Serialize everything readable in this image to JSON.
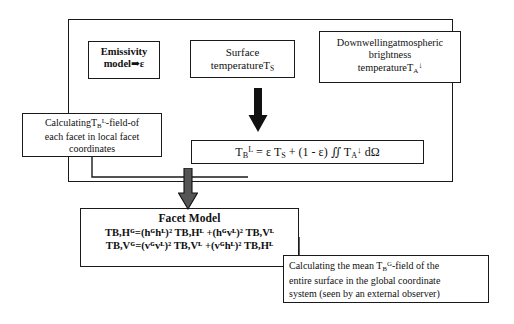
{
  "diagram": {
    "ink_color": "#1a1a1a",
    "background": "#ffffff"
  },
  "outer_frame": {
    "name": "local-facet-coordinate-stage-frame"
  },
  "inputs": [
    {
      "id": "emissivity",
      "line1": "Emissivity",
      "line2_prefix": "model",
      "arrow_glyph": "➡",
      "line2_suffix": "ε"
    },
    {
      "id": "surface_temperature",
      "line1": "Surface",
      "line2_text": "temperatureT",
      "line2_sub": "S"
    },
    {
      "id": "downwelling",
      "line1": "Downwellingatmospheric",
      "line2": "brightness",
      "line3_text": "temperatureT",
      "line3_sub": "A",
      "line3_arrow": "↓"
    }
  ],
  "calc_local": {
    "line1_pre": "Calculating",
    "line1_sym_base": "T",
    "line1_sym_sub": "B",
    "line1_sym_sup": "L",
    "line1_post": "-field-of",
    "line2": "each facet in local facet",
    "line3": "coordinates"
  },
  "equation": {
    "lhs_base": "T",
    "lhs_sub": "B",
    "lhs_sup": "L",
    "eq": "=",
    "term1": "ε T",
    "term1_sub": "S",
    "plus": "+",
    "factor": "(1 - ε)",
    "integral": "∬",
    "term2_base": "T",
    "term2_sub": "A",
    "term2_arrow": "↓",
    "differential": "dΩ"
  },
  "facet_model": {
    "title": "Facet Model",
    "equation_1": "TB,Hᴳ=(hᴳhᴸ)² TB,Hᴸ +(hᴳvᴸ)² TB,Vᴸ",
    "equation_2": "TB,Vᴳ=(vᴳvᴸ)² TB,Vᴸ +(vᴳhᴸ)² TB,Hᴸ"
  },
  "calc_global": {
    "line1_pre": "Calculating the mean ",
    "line1_sym_base": "T",
    "line1_sym_sub": "B",
    "line1_sym_sup": "G",
    "line1_post": "-field of the",
    "line2": "entire surface in the global coordinate",
    "line3": "system (seen by an external observer)"
  },
  "arrows": {
    "top_arrow": "down-block-arrow",
    "mid_arrow": "down-block-arrow"
  }
}
